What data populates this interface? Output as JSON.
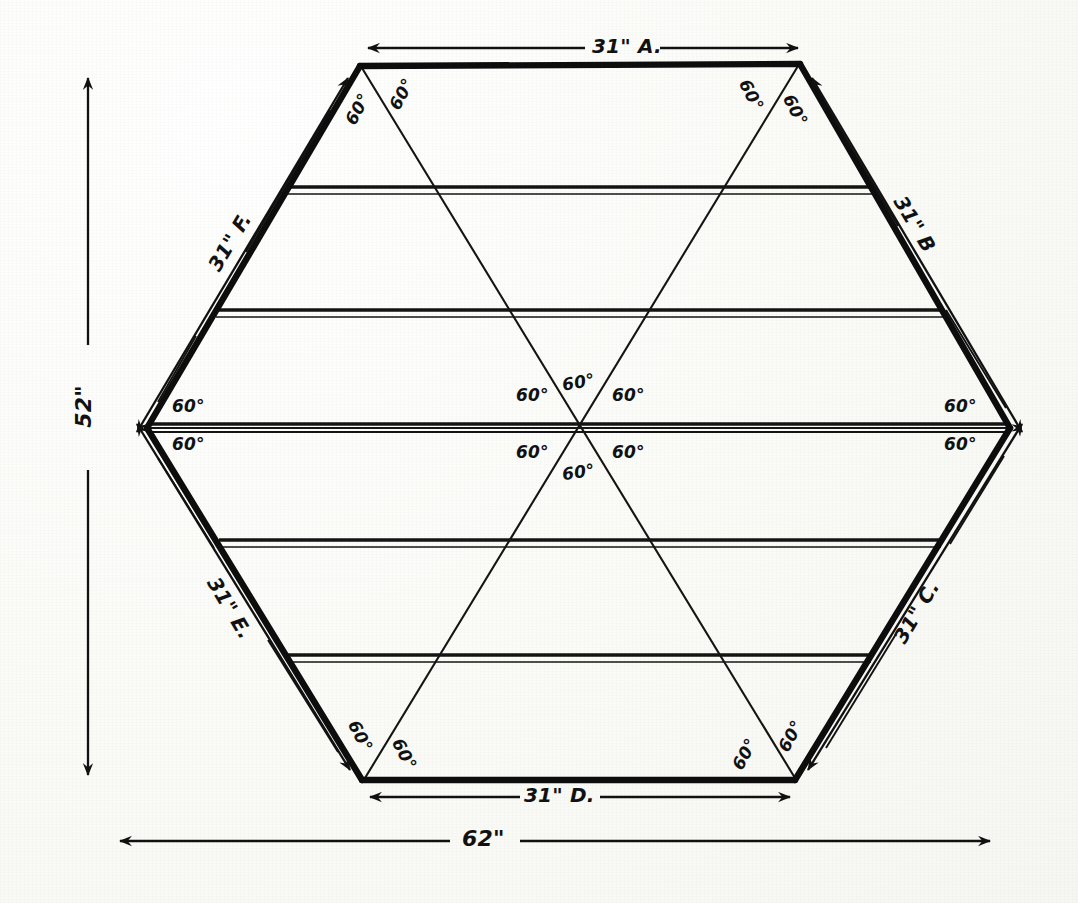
{
  "drawing": {
    "title": "Hexagon Frame Plan",
    "ink_color": "#111111",
    "paper_color": "#fbfbf8"
  },
  "dimensions": {
    "side_a": "31\" A.",
    "side_b": "31\" B",
    "side_c": "31\" C.",
    "side_d": "31\" D.",
    "side_e": "31\" E.",
    "side_f": "31\" F.",
    "overall_height": "52\"",
    "overall_width": "62\""
  },
  "angles": {
    "value": "60°",
    "top_left_outer": "60°",
    "top_left_inner": "60°",
    "top_right_inner": "60°",
    "top_right_outer": "60°",
    "left_upper": "60°",
    "left_lower": "60°",
    "right_upper": "60°",
    "right_lower": "60°",
    "center_upper_left": "60°",
    "center_upper_mid": "60°",
    "center_upper_right": "60°",
    "center_lower_left": "60°",
    "center_lower_mid": "60°",
    "center_lower_right": "60°",
    "bottom_left_outer": "60°",
    "bottom_left_inner": "60°",
    "bottom_right_inner": "60°",
    "bottom_right_outer": "60°"
  },
  "geometry": {
    "shape": "hexagon",
    "vertices": [
      {
        "name": "top-left",
        "x": 360,
        "y": 66
      },
      {
        "name": "top-right",
        "x": 800,
        "y": 64
      },
      {
        "name": "right",
        "x": 1010,
        "y": 428
      },
      {
        "name": "bottom-right",
        "x": 795,
        "y": 780
      },
      {
        "name": "bottom-left",
        "x": 362,
        "y": 780
      },
      {
        "name": "left",
        "x": 147,
        "y": 428
      }
    ],
    "slat_rows": 6,
    "diagonals": 3
  }
}
